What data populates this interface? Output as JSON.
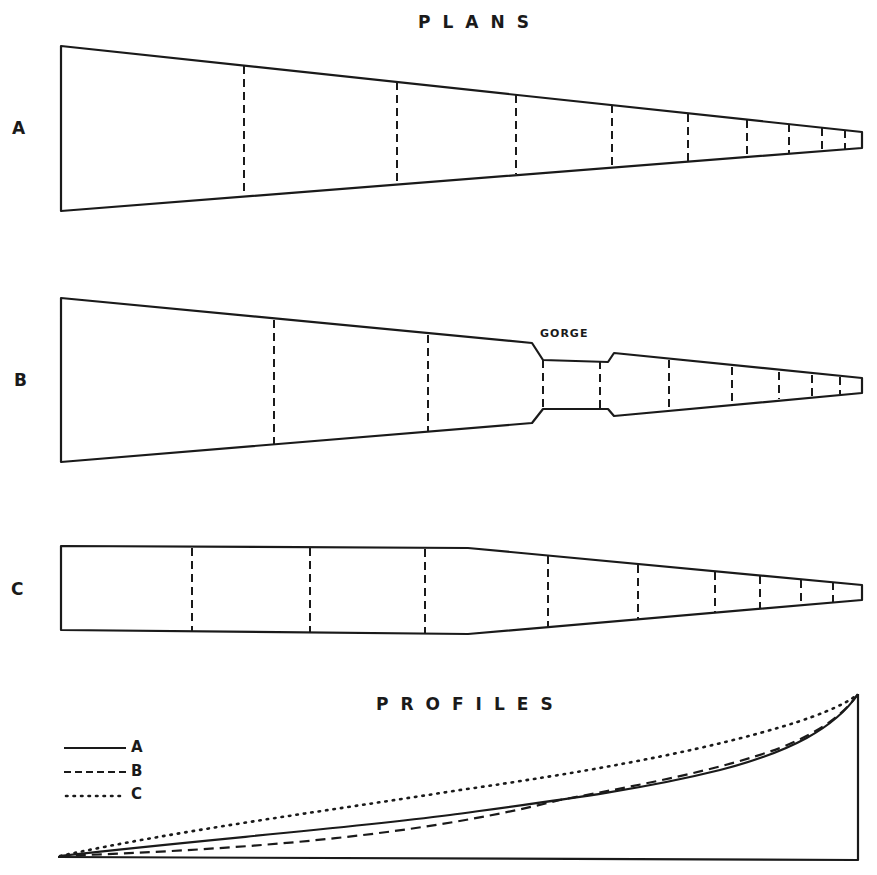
{
  "titles": {
    "plans": "PLANS",
    "profiles": "PROFILES"
  },
  "plans": [
    {
      "label": "A",
      "description": "uniformly tapering plan",
      "sections": 10
    },
    {
      "label": "B",
      "description": "tapering plan with gorge constriction",
      "annotation": "GORGE",
      "sections": 10
    },
    {
      "label": "C",
      "description": "parallel then tapering plan",
      "sections": 10
    }
  ],
  "legend": [
    {
      "label": "A",
      "style": "solid"
    },
    {
      "label": "B",
      "style": "dashed"
    },
    {
      "label": "C",
      "style": "dotted"
    }
  ],
  "colors": {
    "ink": "#1a1a1a",
    "paper": "#ffffff"
  }
}
